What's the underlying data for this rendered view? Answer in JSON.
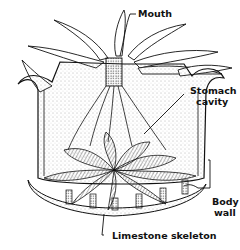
{
  "diagram": {
    "labels": {
      "mouth": "Mouth",
      "stomach_line1": "Stomach",
      "stomach_line2": "cavity",
      "body_line1": "Body",
      "body_line2": "wall",
      "skeleton": "Limestone skeleton"
    },
    "colors": {
      "ink": "#111111",
      "background": "#ffffff",
      "stipple": "#555555"
    }
  }
}
